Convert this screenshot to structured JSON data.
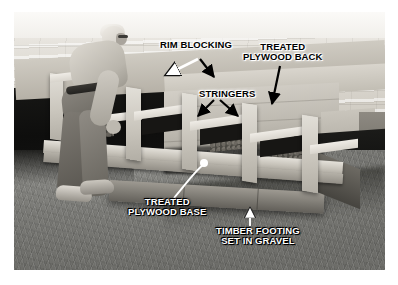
{
  "image": {
    "subject": "Man building deck stairs outdoors",
    "style": "black-and-white instructional photo with bold callout labels",
    "border_color": "#ffffff",
    "photo_box": {
      "left": 14,
      "top": 12,
      "width": 371,
      "height": 258
    }
  },
  "callouts": [
    {
      "id": "rim-blocking",
      "text": "RIM BLOCKING",
      "color": "#000000",
      "x": 160,
      "y": 40,
      "arrows": [
        {
          "style": "white",
          "from": [
            196,
            58
          ],
          "to": [
            168,
            74
          ]
        },
        {
          "style": "black",
          "from": [
            204,
            58
          ],
          "to": [
            215,
            76
          ]
        }
      ]
    },
    {
      "id": "treated-plywood-back",
      "text": "TREATED\nPLYWOOD BACK",
      "color": "#000000",
      "x": 243,
      "y": 42,
      "arrows": [
        {
          "style": "black",
          "from": [
            278,
            66
          ],
          "to": [
            270,
            100
          ]
        }
      ]
    },
    {
      "id": "stringers",
      "text": "STRINGERS",
      "color": "#000000",
      "x": 199,
      "y": 89,
      "arrows": [
        {
          "style": "black",
          "from": [
            213,
            100
          ],
          "to": [
            198,
            114
          ]
        },
        {
          "style": "black",
          "from": [
            222,
            100
          ],
          "to": [
            238,
            114
          ]
        }
      ]
    },
    {
      "id": "treated-plywood-base",
      "text": "TREATED\nPLYWOOD BASE",
      "color": "#ffffff",
      "x": 128,
      "y": 197,
      "arrows": [
        {
          "style": "white-line",
          "from": [
            170,
            196
          ],
          "to": [
            190,
            166
          ]
        }
      ]
    },
    {
      "id": "timber-footing-set-in-gravel",
      "text": "TIMBER FOOTING\nSET IN GRAVEL",
      "color": "#ffffff",
      "x": 216,
      "y": 226,
      "arrows": [
        {
          "style": "white-line",
          "from": [
            249,
            224
          ],
          "to": [
            249,
            208
          ]
        }
      ]
    }
  ],
  "scene_elements": [
    {
      "name": "deck-surface",
      "label": "Upper deck decking boards"
    },
    {
      "name": "deck-fascia",
      "label": "Deck front rim board"
    },
    {
      "name": "stair-stringers",
      "label": "Sawtooth stair stringers"
    },
    {
      "name": "timber-footing",
      "label": "Timber footing beam on grass"
    },
    {
      "name": "lawn",
      "label": "Grass lawn"
    },
    {
      "name": "worker",
      "label": "Man bending over placing stringer"
    },
    {
      "name": "power-tool",
      "label": "Power tool with cord on deck"
    }
  ]
}
